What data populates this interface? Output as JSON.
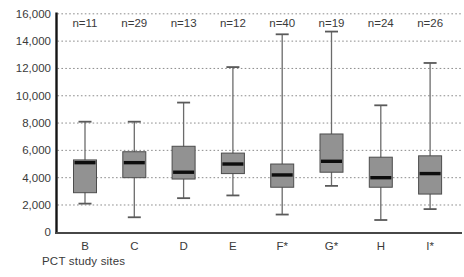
{
  "chart_data": {
    "type": "boxplot",
    "title": "",
    "xlabel": "PCT study sites",
    "ylabel": "",
    "ylim": [
      0,
      16000
    ],
    "grid": "horizontal-dotted",
    "yticks": [
      {
        "value": 0,
        "label": "0"
      },
      {
        "value": 2000,
        "label": "2,000"
      },
      {
        "value": 4000,
        "label": "4,000"
      },
      {
        "value": 6000,
        "label": "6,000"
      },
      {
        "value": 8000,
        "label": "8,000"
      },
      {
        "value": 10000,
        "label": "10,000"
      },
      {
        "value": 12000,
        "label": "12,000"
      },
      {
        "value": 14000,
        "label": "14,000"
      },
      {
        "value": 16000,
        "label": "16,000"
      }
    ],
    "sites": [
      {
        "label": "B",
        "n_label": "n=11",
        "whisker_low": 2100,
        "q1": 2900,
        "median": 5100,
        "q3": 5300,
        "whisker_high": 8100
      },
      {
        "label": "C",
        "n_label": "n=29",
        "whisker_low": 1100,
        "q1": 4000,
        "median": 5100,
        "q3": 5900,
        "whisker_high": 8100
      },
      {
        "label": "D",
        "n_label": "n=13",
        "whisker_low": 2500,
        "q1": 3900,
        "median": 4400,
        "q3": 6300,
        "whisker_high": 9500
      },
      {
        "label": "E",
        "n_label": "n=12",
        "whisker_low": 2700,
        "q1": 4300,
        "median": 5000,
        "q3": 5800,
        "whisker_high": 12100
      },
      {
        "label": "F*",
        "n_label": "n=40",
        "whisker_low": 1300,
        "q1": 3300,
        "median": 4200,
        "q3": 5000,
        "whisker_high": 14500
      },
      {
        "label": "G*",
        "n_label": "n=19",
        "whisker_low": 3400,
        "q1": 4400,
        "median": 5200,
        "q3": 7200,
        "whisker_high": 14700
      },
      {
        "label": "H",
        "n_label": "n=24",
        "whisker_low": 900,
        "q1": 3300,
        "median": 4000,
        "q3": 5500,
        "whisker_high": 9300
      },
      {
        "label": "I*",
        "n_label": "n=26",
        "whisker_low": 1700,
        "q1": 2800,
        "median": 4300,
        "q3": 5600,
        "whisker_high": 12400
      }
    ],
    "colors": {
      "box_fill": "#929292",
      "box_border": "#4d4d4d",
      "median": "#0d0d0d",
      "whisker": "#6b6b6b",
      "whisker_cap": "#5a5a5a",
      "gridline": "#8c8c8c",
      "y_axis": "#141414",
      "x_axis": "#474747",
      "text": "#3a3a3a"
    }
  }
}
